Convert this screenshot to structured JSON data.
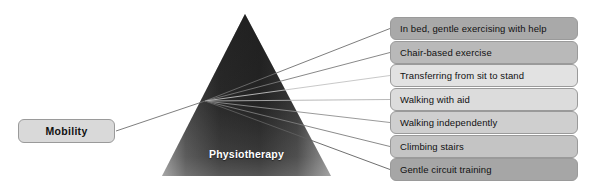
{
  "canvas": {
    "width": 598,
    "height": 184,
    "background": "#ffffff"
  },
  "diagram": {
    "type": "spider-fan-diagram",
    "root": {
      "label": "Mobility",
      "box_color": "#d9d9d9",
      "border_color": "#9a9a9a",
      "x": 18,
      "y": 119,
      "w": 97,
      "h": 24
    },
    "pyramid": {
      "label": "Physiotherapy",
      "label_color": "#ffffff",
      "apex": {
        "x": 245,
        "y": 14
      },
      "base_left": {
        "x": 162,
        "y": 176
      },
      "base_right": {
        "x": 331,
        "y": 176
      },
      "gradient_dark": "#2b2b2b",
      "gradient_light": "#8f8f8f"
    },
    "hub": {
      "x": 205,
      "y": 101
    },
    "branches": [
      {
        "label": "In bed, gentle exercising with help",
        "box_color": "#a9a9a9",
        "line_color": "#6e6e6e",
        "x": 390,
        "y": 17,
        "w": 188,
        "h": 23
      },
      {
        "label": "Chair-based exercise",
        "box_color": "#b9b9b9",
        "line_color": "#7b7b7b",
        "x": 390,
        "y": 41,
        "w": 188,
        "h": 23
      },
      {
        "label": "Transferring from sit to stand",
        "box_color": "#e2e2e2",
        "line_color": "#c2c2c2",
        "x": 390,
        "y": 64,
        "w": 188,
        "h": 23
      },
      {
        "label": "Walking with aid",
        "box_color": "#dcdcdc",
        "line_color": "#b0b0b0",
        "x": 390,
        "y": 88,
        "w": 188,
        "h": 23
      },
      {
        "label": "Walking independently",
        "box_color": "#cfcfcf",
        "line_color": "#8e8e8e",
        "x": 390,
        "y": 111,
        "w": 188,
        "h": 23
      },
      {
        "label": "Climbing stairs",
        "box_color": "#c4c4c4",
        "line_color": "#7d7d7d",
        "x": 390,
        "y": 135,
        "w": 188,
        "h": 23
      },
      {
        "label": "Gentle circuit training",
        "box_color": "#a6a6a6",
        "line_color": "#5f5f5f",
        "x": 390,
        "y": 158,
        "w": 188,
        "h": 23
      }
    ]
  }
}
